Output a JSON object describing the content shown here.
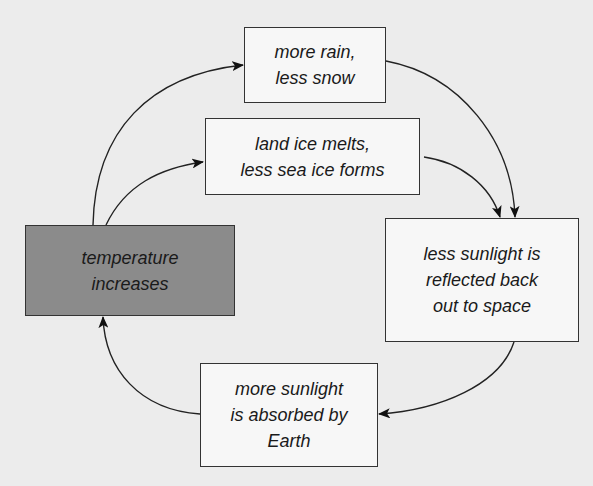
{
  "diagram": {
    "type": "feedback-loop",
    "nodes": {
      "temperature": {
        "label": "temperature\nincreases",
        "fill": "#8b8b8b"
      },
      "rain": {
        "label": "more rain,\nless snow"
      },
      "ice": {
        "label": "land ice melts,\nless sea ice forms"
      },
      "reflected": {
        "label": "less sunlight is\nreflected back\nout to space"
      },
      "absorbed": {
        "label": "more sunlight\nis absorbed by\nEarth"
      }
    },
    "edges": [
      {
        "from": "temperature",
        "to": "rain"
      },
      {
        "from": "temperature",
        "to": "ice"
      },
      {
        "from": "rain",
        "to": "reflected"
      },
      {
        "from": "ice",
        "to": "reflected"
      },
      {
        "from": "reflected",
        "to": "absorbed"
      },
      {
        "from": "absorbed",
        "to": "temperature"
      }
    ]
  }
}
